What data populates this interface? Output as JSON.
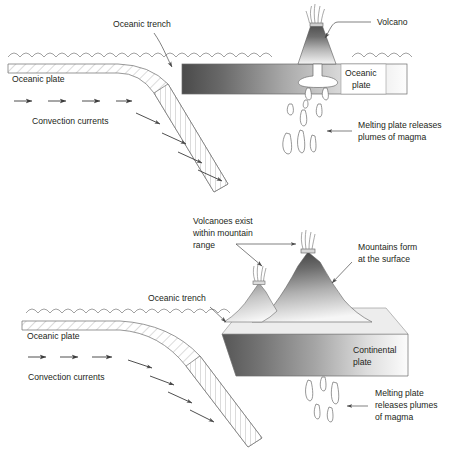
{
  "figure": {
    "background_color": "#ffffff",
    "text_color": "#231f20",
    "line_color": "#6f6f6f",
    "gradient_dark": "#4d4d4d",
    "gradient_light": "#ffffff"
  },
  "panels": [
    {
      "id": "upper",
      "name": "oceanic-oceanic-convergence",
      "labels": {
        "oceanic_trench": "Oceanic trench",
        "volcano": "Volcano",
        "oceanic_plate_left": "Oceanic plate",
        "oceanic_plate_right_line1": "Oceanic",
        "oceanic_plate_right_line2": "plate",
        "convection_currents": "Convection currents",
        "melting_line1": "Melting plate releases",
        "melting_line2": "plumes of magma"
      }
    },
    {
      "id": "lower",
      "name": "oceanic-continental-convergence",
      "labels": {
        "volcanoes_line1": "Volcanoes exist",
        "volcanoes_line2": "within mountain",
        "volcanoes_line3": "range",
        "mountains_line1": "Mountains form",
        "mountains_line2": "at the surface",
        "oceanic_trench": "Oceanic trench",
        "oceanic_plate": "Oceanic plate",
        "continental_plate_line1": "Continental",
        "continental_plate_line2": "plate",
        "convection_currents": "Convection currents",
        "melting_line1": "Melting plate",
        "melting_line2": "releases plumes",
        "melting_line3": "of magma"
      }
    }
  ]
}
